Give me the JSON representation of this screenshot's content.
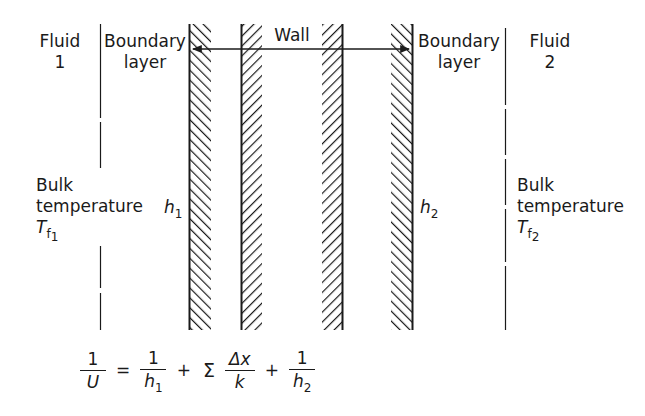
{
  "diagram": {
    "regions": {
      "fluid_left": {
        "line1": "Fluid",
        "line2": "1"
      },
      "boundary_left": {
        "line1": "Boundary",
        "line2": "layer"
      },
      "wall": {
        "label": "Wall"
      },
      "boundary_right": {
        "line1": "Boundary",
        "line2": "layer"
      },
      "fluid_right": {
        "line1": "Fluid",
        "line2": "2"
      }
    },
    "bulk_left": {
      "line1": "Bulk",
      "line2": "temperature",
      "symbol": "T",
      "sub": "f",
      "subsub": "1"
    },
    "bulk_right": {
      "line1": "Bulk",
      "line2": "temperature",
      "symbol": "T",
      "sub": "f",
      "subsub": "2"
    },
    "h_left": {
      "symbol": "h",
      "sub": "1"
    },
    "h_right": {
      "symbol": "h",
      "sub": "2"
    },
    "wall_layers": [
      {
        "x": 189,
        "width": 22,
        "hatch": "forward",
        "solid_edge": "left"
      },
      {
        "x": 241,
        "width": 21,
        "hatch": "back",
        "solid_edge": "left"
      },
      {
        "x": 322,
        "width": 21,
        "hatch": "back",
        "solid_edge": "right"
      },
      {
        "x": 391,
        "width": 22,
        "hatch": "forward",
        "solid_edge": "right"
      }
    ],
    "divider_lines": [
      {
        "x": 100,
        "label": "fluid1-boundary divider"
      },
      {
        "x": 505,
        "label": "boundary-fluid2 divider"
      }
    ],
    "arrow": {
      "from_x": 190,
      "to_x": 412,
      "y": 49,
      "double_headed": true
    },
    "colors": {
      "ink": "#1a1a1a",
      "background": "#ffffff"
    }
  },
  "equation": {
    "lhs": {
      "num": "1",
      "den": "U"
    },
    "equals": "=",
    "term1": {
      "num": "1",
      "den": "h",
      "den_sub": "1"
    },
    "plus1": "+",
    "sigma": "Σ",
    "term2": {
      "num": "Δx",
      "den": "k"
    },
    "plus2": "+",
    "term3": {
      "num": "1",
      "den": "h",
      "den_sub": "2"
    }
  }
}
